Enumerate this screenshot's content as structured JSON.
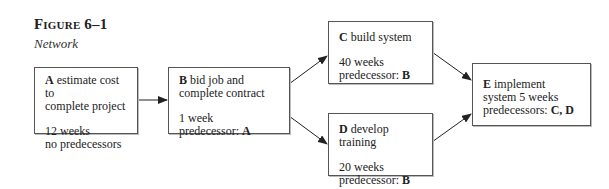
{
  "figure": {
    "title": "Figure 6–1",
    "subtitle": "Network"
  },
  "nodes": [
    {
      "id": "A",
      "label": "estimate cost to",
      "label2": "complete project",
      "duration": "12 weeks",
      "pred_prefix": "no predecessors",
      "pred": ""
    },
    {
      "id": "B",
      "label": "bid job and",
      "label2": "complete contract",
      "duration": "1 week",
      "pred_prefix": "predecessor: ",
      "pred": "A"
    },
    {
      "id": "C",
      "label": "build system",
      "label2": "",
      "duration": "40 weeks",
      "pred_prefix": "predecessor: ",
      "pred": "B"
    },
    {
      "id": "D",
      "label": "develop training",
      "label2": "",
      "duration": "20 weeks",
      "pred_prefix": "predecessor: ",
      "pred": "B"
    },
    {
      "id": "E",
      "label": "implement",
      "label2": "system 5 weeks",
      "duration": "",
      "pred_prefix": "predecessors: ",
      "pred": "C, D"
    }
  ],
  "edges": [
    {
      "from": "A",
      "to": "B"
    },
    {
      "from": "B",
      "to": "C"
    },
    {
      "from": "B",
      "to": "D"
    },
    {
      "from": "C",
      "to": "E"
    },
    {
      "from": "D",
      "to": "E"
    }
  ]
}
